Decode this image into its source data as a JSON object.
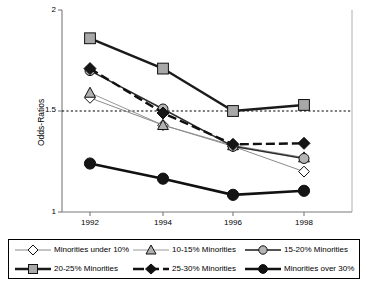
{
  "chart_data": {
    "type": "line",
    "title": "",
    "xlabel": "",
    "ylabel": "Odds-Ratios",
    "categories": [
      "1992",
      "1994",
      "1996",
      "1998"
    ],
    "x": [
      1992,
      1994,
      1996,
      1998
    ],
    "ylim": [
      1,
      2
    ],
    "yticks": [
      "1",
      "1.5",
      "2"
    ],
    "ytick_values": [
      1,
      1.5,
      2
    ],
    "grid": false,
    "reference_line": {
      "value": 1.5,
      "style": "dotted"
    },
    "legend_position": "bottom",
    "series": [
      {
        "name": "Minorities under 10%",
        "marker": "open-diamond",
        "line": "thin-solid",
        "values": [
          1.565,
          1.43,
          1.325,
          1.2
        ]
      },
      {
        "name": "10-15% Minorities",
        "marker": "gray-triangle",
        "line": "thin-solid",
        "values": [
          1.59,
          1.43,
          1.33,
          1.27
        ]
      },
      {
        "name": "15-20% Minorities",
        "marker": "gray-circle",
        "line": "medium-solid",
        "values": [
          1.7,
          1.51,
          1.325,
          1.265
        ]
      },
      {
        "name": "20-25% Minorities",
        "marker": "gray-square",
        "line": "thick-solid",
        "values": [
          1.86,
          1.71,
          1.5,
          1.53
        ]
      },
      {
        "name": "25-30% Minorities",
        "marker": "black-diamond",
        "line": "thick-dashed",
        "values": [
          1.71,
          1.49,
          1.335,
          1.34
        ]
      },
      {
        "name": "Minorities over 30%",
        "marker": "black-circle",
        "line": "thick-solid",
        "values": [
          1.24,
          1.165,
          1.085,
          1.105
        ]
      }
    ]
  },
  "axes": {
    "y_label": "Odds-Ratios",
    "y_ticks": [
      "2",
      "1.5",
      "1"
    ],
    "x_ticks": [
      "1992",
      "1994",
      "1996",
      "1998"
    ]
  },
  "legend": {
    "items": [
      {
        "label": "Minorities under 10%",
        "marker": "open-diamond"
      },
      {
        "label": "10-15% Minorities",
        "marker": "gray-triangle"
      },
      {
        "label": "15-20% Minorities",
        "marker": "gray-circle"
      },
      {
        "label": "20-25% Minorities",
        "marker": "gray-square"
      },
      {
        "label": "25-30% Minorities",
        "marker": "black-diamond"
      },
      {
        "label": "Minorities over 30%",
        "marker": "black-circle"
      }
    ]
  },
  "colors": {
    "axis": "#6b6b6b",
    "line_dark": "#1a1a1a",
    "line_mid": "#4d4d4d",
    "marker_gray": "#a8a8a8",
    "marker_black": "#1a1a1a",
    "marker_white": "#ffffff",
    "reference": "#000000"
  }
}
